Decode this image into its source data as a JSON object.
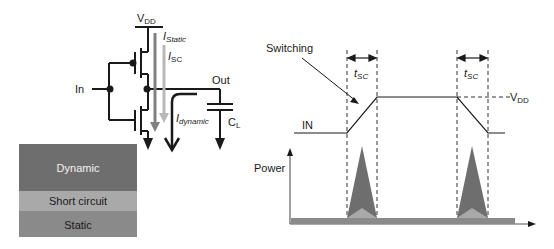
{
  "circuit": {
    "vdd_label": "V",
    "vdd_sub": "DD",
    "i_static": "I",
    "i_static_sub": "Static",
    "i_sc": "I",
    "i_sc_sub": "SC",
    "i_dynamic": "I",
    "i_dynamic_sub": "dynamic",
    "in_label": "In",
    "out_label": "Out",
    "cl_label": "C",
    "cl_sub": "L"
  },
  "legend": {
    "items": [
      {
        "label": "Dynamic",
        "color": "#6e6e6e"
      },
      {
        "label": "Short circuit",
        "color": "#a9a9a9"
      },
      {
        "label": "Static",
        "color": "#8a8a8a"
      }
    ]
  },
  "timing": {
    "switching_label": "Switching",
    "tsc_label_1": "t",
    "tsc_sub_1": "SC",
    "tsc_label_2": "t",
    "tsc_sub_2": "SC",
    "vdd_label": "V",
    "vdd_sub": "DD",
    "in_label": "IN",
    "power_label": "Power"
  },
  "colors": {
    "line": "#1a1a1a",
    "i_static_arrow": "#808080",
    "i_sc_arrow": "#b8b8b8",
    "dynamic_fill": "#6e6e6e",
    "short_fill": "#a9a9a9",
    "static_fill": "#8a8a8a",
    "dash": "#333333"
  }
}
